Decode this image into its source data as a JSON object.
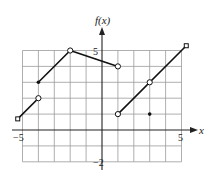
{
  "chart_data": {
    "type": "line",
    "title": "",
    "xlabel": "x",
    "ylabel": "f(x)",
    "xlim": [
      -5.3,
      5.3
    ],
    "ylim": [
      -2,
      5.3
    ],
    "grid": true,
    "x_tick_labels": [
      {
        "value": -5,
        "label": "-5"
      },
      {
        "value": 5,
        "label": "5"
      }
    ],
    "y_tick_labels": [
      {
        "value": 5,
        "label": "5"
      },
      {
        "value": -2,
        "label": "-2"
      }
    ],
    "grid_range": {
      "x": [
        -5,
        5
      ],
      "y": [
        -2,
        5
      ]
    },
    "segments": [
      {
        "name": "segment-1",
        "points": [
          [
            -5.3,
            0.7
          ],
          [
            -4,
            2
          ]
        ],
        "start": "arrow",
        "end": "open"
      },
      {
        "name": "segment-2",
        "points": [
          [
            -4,
            3
          ],
          [
            -2,
            5
          ]
        ],
        "start": "closed",
        "end": "open"
      },
      {
        "name": "segment-3",
        "points": [
          [
            -2,
            5
          ],
          [
            1,
            4
          ]
        ],
        "start": "open",
        "end": "open"
      },
      {
        "name": "segment-4",
        "points": [
          [
            1,
            1
          ],
          [
            5.3,
            5.3
          ]
        ],
        "start": "open",
        "end": "arrow"
      }
    ],
    "marked_points": [
      {
        "x": -4,
        "y": 2,
        "style": "open"
      },
      {
        "x": -4,
        "y": 3,
        "style": "closed"
      },
      {
        "x": -2,
        "y": 5,
        "style": "open"
      },
      {
        "x": 1,
        "y": 4,
        "style": "open"
      },
      {
        "x": 1,
        "y": 1,
        "style": "open"
      },
      {
        "x": 3,
        "y": 3,
        "style": "open"
      },
      {
        "x": 3,
        "y": 1,
        "style": "closed"
      }
    ]
  },
  "labels": {
    "y_axis": "f(x)",
    "x_axis": "x",
    "x_min": "−5",
    "x_max": "5",
    "y_max": "5",
    "y_min": "−2"
  }
}
